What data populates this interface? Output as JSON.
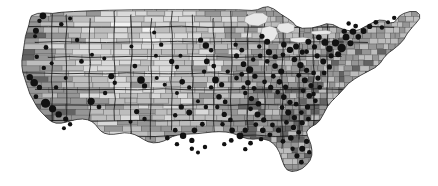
{
  "figure": {
    "title": "United States county choropleth with proportional point overlay",
    "type": "map",
    "width": 438,
    "height": 186,
    "background_color": "#ffffff",
    "projection": "albers-usa",
    "border_color": "#2b2b2b",
    "point_color": "#111111",
    "water_color": "#e8e8e8",
    "legend_visible": false,
    "axis_labels_visible": false,
    "text_visible": false
  },
  "chart_data": {
    "type": "heatmap",
    "title": "United States county choropleth with proportional point overlay",
    "xlabel": "",
    "ylabel": "",
    "grid": false,
    "legend": "none",
    "value_scale": {
      "name": "grayscale",
      "low_color": "#f2f2f2",
      "high_color": "#2e2e2e",
      "classes": 6,
      "class_colors": [
        "#f2f2f2",
        "#d9d9d9",
        "#bdbdbd",
        "#969696",
        "#636363",
        "#2e2e2e"
      ]
    },
    "features": "3100 counties",
    "overlay": {
      "type": "scatter",
      "marker": "circle",
      "color": "#111111",
      "radius_range_px": [
        1.6,
        5.6
      ],
      "count": 420
    },
    "regions": [
      {
        "name": "Pacific Northwest",
        "tone": "mid-dark"
      },
      {
        "name": "California",
        "tone": "dark"
      },
      {
        "name": "Great Basin",
        "tone": "light"
      },
      {
        "name": "Great Plains",
        "tone": "light"
      },
      {
        "name": "Upper Midwest",
        "tone": "mid"
      },
      {
        "name": "Great Lakes water",
        "tone": "very-light"
      },
      {
        "name": "Appalachia",
        "tone": "dark"
      },
      {
        "name": "Deep South",
        "tone": "dark"
      },
      {
        "name": "Northeast Megalopolis",
        "tone": "dark"
      },
      {
        "name": "Florida",
        "tone": "mid-dark"
      }
    ]
  }
}
